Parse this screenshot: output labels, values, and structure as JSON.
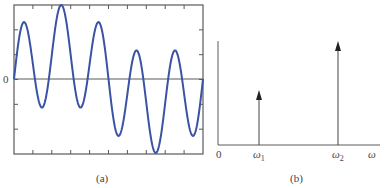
{
  "chart_data": [
    {
      "panel": "(a)",
      "type": "line",
      "title": "",
      "caption": "(a)",
      "xlabel": "",
      "ylabel": "",
      "y_tick_labels": [
        "0"
      ],
      "description": "Time-domain signal: sum of two sinusoids, A1·sin(ω1 t) + A2·sin(ω2 t), with ω2 = 5·ω1 and A2 ≈ 2·A1",
      "series": [
        {
          "name": "signal",
          "color": "#3a53a4",
          "components": [
            {
              "frequency_ratio": 1,
              "amplitude": 0.34
            },
            {
              "frequency_ratio": 5,
              "amplitude": 0.66
            }
          ]
        }
      ],
      "xlim": [
        0,
        1
      ],
      "ylim": [
        -1,
        1
      ],
      "x_ticks": 10,
      "y_ticks": 6,
      "grid": false,
      "zero_line": true
    },
    {
      "panel": "(b)",
      "type": "bar",
      "subtype": "impulse-spectrum",
      "caption": "(b)",
      "xlabel": "ω",
      "ylabel": "",
      "origin_label": "0",
      "categories": [
        "ω1",
        "ω2"
      ],
      "x_positions": [
        0.26,
        0.78
      ],
      "values": [
        0.52,
        1.0
      ],
      "arrow_heads": true
    }
  ],
  "labels": {
    "a_zero": "0",
    "a_caption": "(a)",
    "b_origin": "0",
    "b_omega1": "ω",
    "b_omega1_sub": "1",
    "b_omega2": "ω",
    "b_omega2_sub": "2",
    "b_axis": "ω",
    "b_caption": "(b)"
  },
  "colors": {
    "curve": "#3a53a4",
    "axes": "#555555",
    "text": "#444444"
  }
}
